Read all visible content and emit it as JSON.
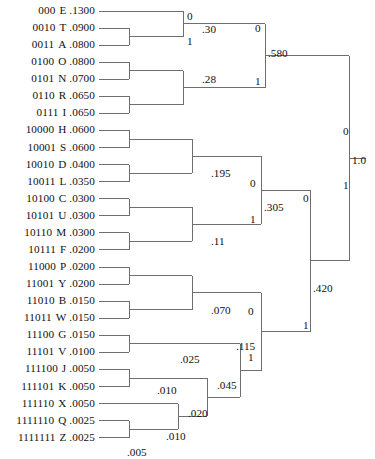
{
  "diagram": {
    "type": "binary-merge-tree",
    "line_color": "#6e6e6e",
    "text_color": "#111111",
    "background": "#ffffff",
    "root_value": "1.0",
    "root_bit_top": "0",
    "root_bit_bottom": "1"
  },
  "leaves": [
    {
      "code": "000",
      "symbol": "E",
      "prob": ".1300"
    },
    {
      "code": "0010",
      "symbol": "T",
      "prob": ".0900"
    },
    {
      "code": "0011",
      "symbol": "A",
      "prob": ".0800"
    },
    {
      "code": "0100",
      "symbol": "O",
      "prob": ".0800"
    },
    {
      "code": "0101",
      "symbol": "N",
      "prob": ".0700"
    },
    {
      "code": "0110",
      "symbol": "R",
      "prob": ".0650"
    },
    {
      "code": "0111",
      "symbol": "I",
      "prob": ".0650"
    },
    {
      "code": "10000",
      "symbol": "H",
      "prob": ".0600"
    },
    {
      "code": "10001",
      "symbol": "S",
      "prob": ".0600"
    },
    {
      "code": "10010",
      "symbol": "D",
      "prob": ".0400"
    },
    {
      "code": "10011",
      "symbol": "L",
      "prob": ".0350"
    },
    {
      "code": "10100",
      "symbol": "C",
      "prob": ".0300"
    },
    {
      "code": "10101",
      "symbol": "U",
      "prob": ".0300"
    },
    {
      "code": "10110",
      "symbol": "M",
      "prob": ".0300"
    },
    {
      "code": "10111",
      "symbol": "F",
      "prob": ".0200"
    },
    {
      "code": "11000",
      "symbol": "P",
      "prob": ".0200"
    },
    {
      "code": "11001",
      "symbol": "Y",
      "prob": ".0200"
    },
    {
      "code": "11010",
      "symbol": "B",
      "prob": ".0150"
    },
    {
      "code": "11011",
      "symbol": "W",
      "prob": ".0150"
    },
    {
      "code": "11100",
      "symbol": "G",
      "prob": ".0150"
    },
    {
      "code": "11101",
      "symbol": "V",
      "prob": ".0100"
    },
    {
      "code": "111100",
      "symbol": "J",
      "prob": ".0050"
    },
    {
      "code": "111101",
      "symbol": "K",
      "prob": ".0050"
    },
    {
      "code": "111110",
      "symbol": "X",
      "prob": ".0050"
    },
    {
      "code": "1111110",
      "symbol": "Q",
      "prob": ".0025"
    },
    {
      "code": "1111111",
      "symbol": "Z",
      "prob": ".0025"
    }
  ],
  "internal_nodes": [
    {
      "id": "n_TA",
      "value": ".30",
      "x": 202,
      "y": 24
    },
    {
      "id": "n_RI",
      "value": ".28",
      "x": 202,
      "y": 74
    },
    {
      "id": "n_580",
      "value": ".580",
      "x": 268,
      "y": 48
    },
    {
      "id": "n_HSDL",
      "value": ".195",
      "x": 211,
      "y": 168
    },
    {
      "id": "n_CUMF",
      "value": ".11",
      "x": 211,
      "y": 236
    },
    {
      "id": "n_305",
      "value": ".305",
      "x": 264,
      "y": 202
    },
    {
      "id": "n_PYBW",
      "value": ".070",
      "x": 211,
      "y": 305
    },
    {
      "id": "n_GV",
      "value": ".025",
      "x": 180,
      "y": 354
    },
    {
      "id": "n_JK",
      "value": ".010",
      "x": 157,
      "y": 385
    },
    {
      "id": "n_QZ",
      "value": ".005",
      "x": 127,
      "y": 447
    },
    {
      "id": "n_XQZ",
      "value": ".010",
      "x": 166,
      "y": 431
    },
    {
      "id": "n_020",
      "value": ".020",
      "x": 188,
      "y": 408
    },
    {
      "id": "n_045",
      "value": ".045",
      "x": 217,
      "y": 380
    },
    {
      "id": "n_115",
      "value": ".115",
      "x": 236,
      "y": 341
    },
    {
      "id": "n_420",
      "value": ".420",
      "x": 313,
      "y": 283
    },
    {
      "id": "n_root",
      "value": "1.0",
      "x": 352,
      "y": 155
    }
  ],
  "bit_labels": [
    {
      "bit": "0",
      "x": 187,
      "y": 11
    },
    {
      "bit": "1",
      "x": 187,
      "y": 36
    },
    {
      "bit": "0",
      "x": 255,
      "y": 23
    },
    {
      "bit": "1",
      "x": 255,
      "y": 76
    },
    {
      "bit": "0",
      "x": 250,
      "y": 178
    },
    {
      "bit": "1",
      "x": 250,
      "y": 214
    },
    {
      "bit": "0",
      "x": 303,
      "y": 193
    },
    {
      "bit": "1",
      "x": 303,
      "y": 320
    },
    {
      "bit": "0",
      "x": 248,
      "y": 306
    },
    {
      "bit": "1",
      "x": 248,
      "y": 352
    },
    {
      "bit": "0",
      "x": 343,
      "y": 126
    },
    {
      "bit": "1",
      "x": 343,
      "y": 180
    }
  ],
  "bottom_note": ""
}
